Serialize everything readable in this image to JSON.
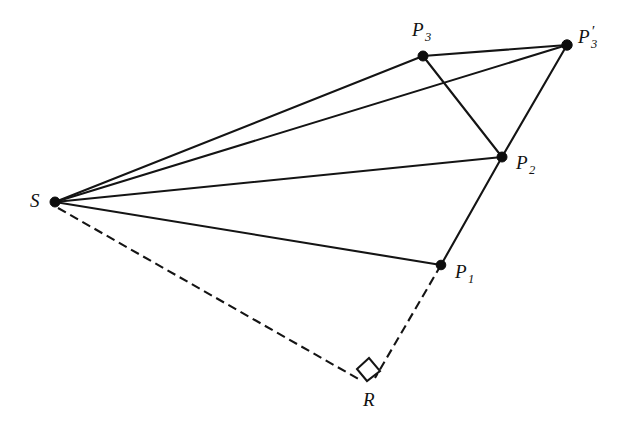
{
  "figure": {
    "type": "geometry-diagram",
    "width": 619,
    "height": 429,
    "background_color": "#ffffff",
    "line_color": "#141414"
  },
  "labels": {
    "S": "S",
    "P1_base": "P",
    "P1_sub": "1",
    "P2_base": "P",
    "P2_sub": "2",
    "P3_base": "P",
    "P3_sub": "3",
    "P3prime_base": "P",
    "P3prime_sub": "3",
    "P3prime_mark": "′",
    "R": "R"
  },
  "points": [
    {
      "id": "S",
      "label": "S",
      "x": 55,
      "y": 202,
      "radius": 5.0,
      "label_x": 30,
      "label_y": 192
    },
    {
      "id": "P1",
      "label": "P1",
      "x": 441,
      "y": 265,
      "radius": 4.8,
      "label_x": 455,
      "label_y": 265
    },
    {
      "id": "P2",
      "label": "P2",
      "x": 502,
      "y": 157,
      "radius": 5.0,
      "label_x": 516,
      "label_y": 156
    },
    {
      "id": "P3",
      "label": "P3",
      "x": 423,
      "y": 56,
      "radius": 5.0,
      "label_x": 412,
      "label_y": 22
    },
    {
      "id": "P3p",
      "label": "P3'",
      "x": 567,
      "y": 45,
      "radius": 5.2,
      "label_x": 578,
      "label_y": 28
    },
    {
      "id": "R",
      "label": "R",
      "x": 368,
      "y": 383,
      "radius": 0.0,
      "label_x": 364,
      "label_y": 391
    }
  ],
  "edges": [
    {
      "id": "S-P3",
      "from": "S",
      "to": "P3",
      "style": "solid"
    },
    {
      "id": "S-P3p",
      "from": "S",
      "to": "P3p",
      "style": "solid"
    },
    {
      "id": "S-P2",
      "from": "S",
      "to": "P2",
      "style": "solid"
    },
    {
      "id": "S-P1",
      "from": "S",
      "to": "P1",
      "style": "solid"
    },
    {
      "id": "S-R",
      "from": "S",
      "to": "R",
      "style": "dashed"
    },
    {
      "id": "P1-R",
      "from": "P1",
      "to": "R",
      "style": "dashed"
    },
    {
      "id": "P2-P1",
      "from": "P2",
      "to": "P1",
      "style": "solid"
    },
    {
      "id": "P3-P3p",
      "from": "P3",
      "to": "P3p",
      "style": "solid"
    },
    {
      "id": "P3-P2",
      "from": "P3",
      "to": "P2",
      "style": "solid"
    },
    {
      "id": "P3p-P2",
      "from": "P3p",
      "to": "P2",
      "style": "solid"
    }
  ],
  "right_angle": {
    "at": "R",
    "size": 13,
    "points": "356,368 369,358 379,371 366,381"
  }
}
